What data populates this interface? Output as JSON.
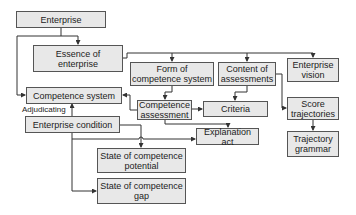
{
  "diagram": {
    "nodes": [
      {
        "id": "enterprise",
        "label": "Enterprise"
      },
      {
        "id": "essence",
        "label": "Essence of\nenterprise"
      },
      {
        "id": "form",
        "label": "Form of\ncompetence system"
      },
      {
        "id": "content",
        "label": "Content of\nassessments"
      },
      {
        "id": "vision",
        "label": "Enterprise\nvision"
      },
      {
        "id": "competence_system",
        "label": "Competence system"
      },
      {
        "id": "competence_assessment",
        "label": "Competence\nassessment"
      },
      {
        "id": "criteria",
        "label": "Criteria"
      },
      {
        "id": "score",
        "label": "Score\ntrajectories"
      },
      {
        "id": "grammar",
        "label": "Trajectory\ngrammar"
      },
      {
        "id": "condition",
        "label": "Enterprise condition"
      },
      {
        "id": "explanation",
        "label": "Explanation act"
      },
      {
        "id": "potential",
        "label": "State of competence\npotential"
      },
      {
        "id": "gap",
        "label": "State of competence\ngap"
      }
    ],
    "edge_labels": {
      "adjudicating": "Adjudicating"
    },
    "colors": {
      "box_fill": "#e8e8e8",
      "box_border": "#555555",
      "line": "#333333"
    }
  }
}
